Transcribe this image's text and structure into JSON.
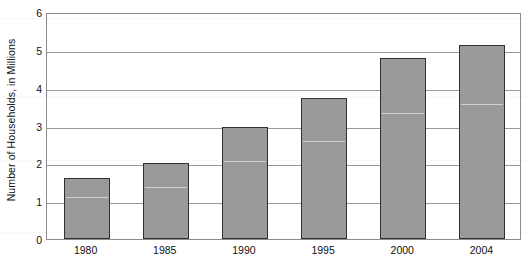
{
  "chart_data": {
    "type": "bar",
    "title": "",
    "xlabel": "",
    "ylabel": "Number of Households, in Millions",
    "categories": [
      "1980",
      "1985",
      "1990",
      "1995",
      "2000",
      "2004"
    ],
    "values": [
      1.6,
      2.02,
      2.95,
      3.72,
      4.78,
      5.13
    ],
    "ylim": [
      0,
      6
    ],
    "ytick_labels": [
      "0",
      "1",
      "2",
      "3",
      "4",
      "5",
      "6"
    ],
    "ytick_values": [
      0,
      1,
      2,
      3,
      4,
      5,
      6
    ],
    "grid": "horizontal",
    "legend": "none",
    "series": [
      {
        "name": "Number of Households",
        "values": [
          1.6,
          2.02,
          2.95,
          3.72,
          4.78,
          5.13
        ]
      }
    ]
  },
  "style": {
    "bar_fill": "#9a9a9a",
    "bar_border": "#303030",
    "gridline_color": "#9a9a9a",
    "axis_color": "#8c8c8c",
    "background": "#ffffff",
    "text_color": "#111111"
  }
}
